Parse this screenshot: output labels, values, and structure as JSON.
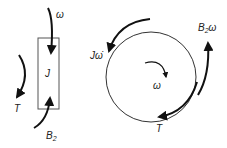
{
  "diagram": {
    "left": {
      "body_label": "J",
      "top_arrow_label": "ω",
      "side_arrow_label": "T",
      "bottom_arrow_label_main": "B",
      "bottom_arrow_label_sub": "2"
    },
    "right": {
      "center_label": "ω",
      "top_left_label": "Jω̇",
      "right_label_main": "B",
      "right_label_sub": "2",
      "right_label_tail": "ω",
      "bottom_label": "T"
    },
    "colors": {
      "stroke": "#333333",
      "arrow": "#111111",
      "background": "#ffffff"
    }
  }
}
